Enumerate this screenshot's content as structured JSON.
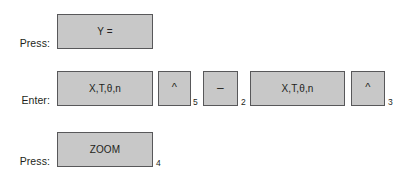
{
  "page": {
    "background_color": "#ffffff",
    "key_fill_color": "#c8c8c8",
    "key_border_color": "#58585a",
    "text_color": "#231f20"
  },
  "rows": [
    {
      "label": "Press:",
      "keys": [
        {
          "name": "y-equals-key",
          "label": "Y =",
          "step": null
        }
      ]
    },
    {
      "label": "Enter:",
      "keys": [
        {
          "name": "x-t-theta-n-key-1",
          "label": "X,T,θ,n",
          "step": null
        },
        {
          "name": "caret-key-1",
          "label": "^",
          "step": "5"
        },
        {
          "name": "minus-key",
          "label": "–",
          "step": "2"
        },
        {
          "name": "x-t-theta-n-key-2",
          "label": "X,T,θ,n",
          "step": null
        },
        {
          "name": "caret-key-2",
          "label": "^",
          "step": "3"
        }
      ]
    },
    {
      "label": "Press:",
      "keys": [
        {
          "name": "zoom-key",
          "label": "ZOOM",
          "step": "4"
        }
      ]
    }
  ]
}
